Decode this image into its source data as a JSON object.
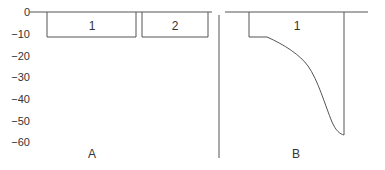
{
  "diagram": {
    "y_axis": {
      "ticks": [
        "0",
        "−10",
        "−20",
        "−30",
        "−40",
        "−50",
        "−60"
      ]
    },
    "panel_a": {
      "label": "A",
      "boxes": [
        {
          "label": "1"
        },
        {
          "label": "2"
        }
      ]
    },
    "panel_b": {
      "label": "B",
      "regions": [
        {
          "label": "1"
        }
      ]
    },
    "line_color": "#555555"
  }
}
